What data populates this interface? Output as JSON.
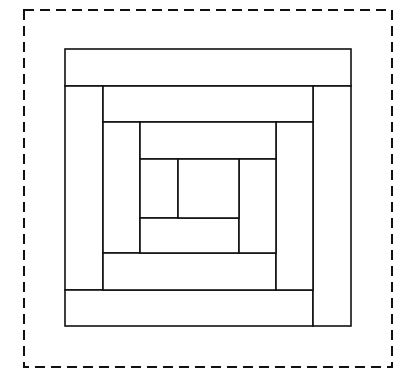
{
  "diagram": {
    "colors": {
      "background": "#ffffff",
      "stroke": "#111111"
    },
    "border": {
      "style": "dashed",
      "x": 24,
      "y": 10,
      "width": 368,
      "height": 357
    },
    "outer": {
      "x": 65,
      "y": 49,
      "width": 286,
      "height": 277
    },
    "pieces": [
      {
        "id": "top-strip-1",
        "x": 65,
        "y": 49,
        "w": 286,
        "h": 37
      },
      {
        "id": "left-strip-1",
        "x": 65,
        "y": 86,
        "w": 38,
        "h": 204
      },
      {
        "id": "bottom-strip-1",
        "x": 65,
        "y": 290,
        "w": 248,
        "h": 36
      },
      {
        "id": "right-strip-1",
        "x": 313,
        "y": 86,
        "w": 38,
        "h": 240
      },
      {
        "id": "top-strip-2",
        "x": 103,
        "y": 86,
        "w": 210,
        "h": 36
      },
      {
        "id": "left-strip-2",
        "x": 103,
        "y": 122,
        "w": 37,
        "h": 131
      },
      {
        "id": "bottom-strip-2",
        "x": 103,
        "y": 253,
        "w": 173,
        "h": 37
      },
      {
        "id": "right-strip-2",
        "x": 276,
        "y": 122,
        "w": 37,
        "h": 168
      },
      {
        "id": "top-strip-3",
        "x": 140,
        "y": 122,
        "w": 136,
        "h": 37
      },
      {
        "id": "left-strip-3",
        "x": 140,
        "y": 159,
        "w": 38,
        "h": 59
      },
      {
        "id": "bottom-strip-3",
        "x": 140,
        "y": 218,
        "w": 99,
        "h": 35
      },
      {
        "id": "right-strip-3",
        "x": 239,
        "y": 159,
        "w": 37,
        "h": 94
      },
      {
        "id": "center-square",
        "x": 178,
        "y": 159,
        "w": 61,
        "h": 59
      }
    ]
  }
}
